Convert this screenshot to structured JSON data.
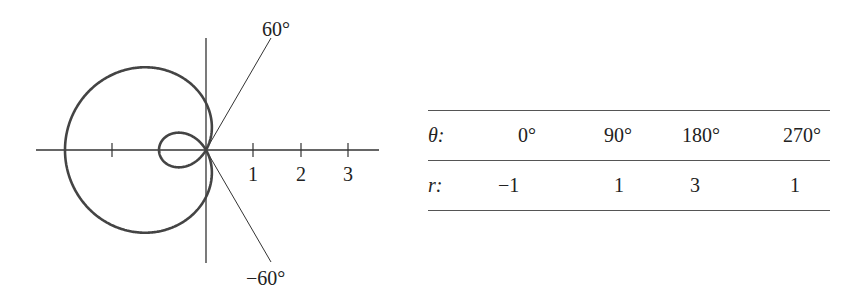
{
  "chart_data": {
    "type": "polar-curve",
    "equation_implied": "r = 1 - 2cos(theta)",
    "title": "",
    "axes": {
      "x_tick_labels": [
        "1",
        "2",
        "3"
      ],
      "x_ticks": [
        -2,
        1,
        2,
        3
      ],
      "unit_px": 47
    },
    "rays": [
      {
        "angle_deg": 60,
        "label": "60°"
      },
      {
        "angle_deg": -60,
        "label": "−60°"
      }
    ],
    "table": {
      "theta_label": "θ:",
      "r_label": "r:",
      "theta": [
        "0°",
        "90°",
        "180°",
        "270°"
      ],
      "r": [
        "−1",
        "1",
        "3",
        "1"
      ]
    }
  },
  "diagram": {
    "ray_labels": {
      "upper": "60°",
      "lower": "−60°"
    },
    "tick_labels": [
      "1",
      "2",
      "3"
    ]
  },
  "table": {
    "header_label": "θ:",
    "row_label": "r:",
    "theta_values": [
      "0°",
      "90°",
      "180°",
      "270°"
    ],
    "r_values": [
      "−1",
      "1",
      "3",
      "1"
    ]
  }
}
